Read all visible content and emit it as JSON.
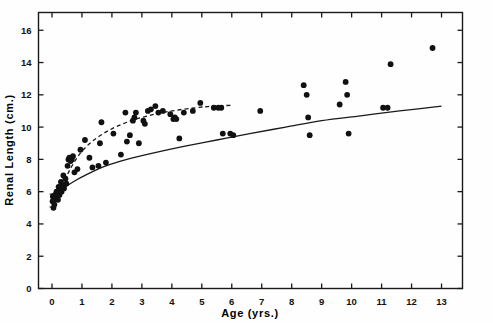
{
  "figure": {
    "title": "",
    "background_color": "#ffffff",
    "ink_color": "#111111"
  },
  "axes": {
    "x_title": "Age (yrs.)",
    "y_title": "Renal Length (cm.)",
    "x_ticks": [
      "0",
      "1",
      "2",
      "3",
      "4",
      "5",
      "6",
      "7",
      "8",
      "9",
      "10",
      "11",
      "12",
      "13"
    ],
    "y_ticks": [
      "0",
      "2",
      "4",
      "6",
      "8",
      "10",
      "12",
      "14",
      "16"
    ]
  },
  "chart_data": {
    "type": "scatter",
    "title": "",
    "xlabel": "Age (yrs.)",
    "ylabel": "Renal Length (cm.)",
    "xlim": [
      -0.45,
      13.7
    ],
    "ylim": [
      0,
      17.1
    ],
    "x_ticks": [
      0,
      1,
      2,
      3,
      4,
      5,
      6,
      7,
      8,
      9,
      10,
      11,
      12,
      13
    ],
    "y_ticks": [
      0,
      2,
      4,
      6,
      8,
      10,
      12,
      14,
      16
    ],
    "grid": false,
    "legend": null,
    "frame": "box",
    "tick_direction": "in",
    "series": [
      {
        "name": "Patient renal length measurements",
        "type": "scatter",
        "marker": "filled-circle",
        "color": "#111111",
        "points": [
          [
            0.02,
            5.4
          ],
          [
            0.03,
            5.7
          ],
          [
            0.05,
            5.0
          ],
          [
            0.06,
            5.5
          ],
          [
            0.08,
            5.2
          ],
          [
            0.1,
            5.8
          ],
          [
            0.12,
            5.6
          ],
          [
            0.15,
            6.0
          ],
          [
            0.18,
            5.9
          ],
          [
            0.2,
            5.5
          ],
          [
            0.22,
            6.3
          ],
          [
            0.25,
            5.8
          ],
          [
            0.28,
            6.2
          ],
          [
            0.3,
            6.6
          ],
          [
            0.32,
            6.0
          ],
          [
            0.35,
            6.4
          ],
          [
            0.38,
            7.0
          ],
          [
            0.4,
            6.2
          ],
          [
            0.45,
            6.8
          ],
          [
            0.48,
            6.5
          ],
          [
            0.52,
            7.6
          ],
          [
            0.55,
            8.0
          ],
          [
            0.58,
            8.1
          ],
          [
            0.62,
            7.9
          ],
          [
            0.66,
            8.0
          ],
          [
            0.7,
            8.2
          ],
          [
            0.75,
            7.2
          ],
          [
            0.85,
            7.4
          ],
          [
            0.95,
            8.6
          ],
          [
            1.1,
            9.2
          ],
          [
            1.25,
            8.1
          ],
          [
            1.35,
            7.5
          ],
          [
            1.55,
            7.6
          ],
          [
            1.6,
            9.0
          ],
          [
            1.65,
            10.3
          ],
          [
            1.8,
            7.8
          ],
          [
            2.05,
            9.6
          ],
          [
            2.3,
            8.3
          ],
          [
            2.45,
            10.9
          ],
          [
            2.5,
            9.1
          ],
          [
            2.6,
            9.5
          ],
          [
            2.7,
            10.4
          ],
          [
            2.75,
            10.6
          ],
          [
            2.8,
            10.9
          ],
          [
            2.9,
            9.0
          ],
          [
            3.05,
            10.4
          ],
          [
            3.1,
            10.2
          ],
          [
            3.2,
            11.0
          ],
          [
            3.3,
            11.1
          ],
          [
            3.45,
            11.3
          ],
          [
            3.55,
            10.9
          ],
          [
            3.7,
            11.0
          ],
          [
            3.95,
            10.8
          ],
          [
            4.05,
            10.5
          ],
          [
            4.1,
            10.6
          ],
          [
            4.15,
            10.5
          ],
          [
            4.25,
            9.3
          ],
          [
            4.4,
            10.9
          ],
          [
            4.7,
            11.0
          ],
          [
            4.95,
            11.5
          ],
          [
            5.4,
            11.2
          ],
          [
            5.55,
            11.2
          ],
          [
            5.65,
            11.2
          ],
          [
            5.7,
            9.6
          ],
          [
            5.95,
            9.6
          ],
          [
            6.05,
            9.5
          ],
          [
            6.95,
            11.0
          ],
          [
            8.4,
            12.6
          ],
          [
            8.5,
            12.0
          ],
          [
            8.55,
            10.6
          ],
          [
            8.6,
            9.5
          ],
          [
            9.6,
            11.4
          ],
          [
            9.8,
            12.8
          ],
          [
            9.85,
            12.0
          ],
          [
            9.9,
            9.6
          ],
          [
            11.05,
            11.2
          ],
          [
            11.2,
            11.2
          ],
          [
            11.3,
            13.9
          ],
          [
            12.7,
            14.9
          ]
        ]
      },
      {
        "name": "Upper reference curve (dashed, mean renal length)",
        "type": "line",
        "style": "dashed",
        "color": "#111111",
        "x_range": [
          0.25,
          6.0
        ],
        "points": [
          [
            0.25,
            5.9
          ],
          [
            0.45,
            6.8
          ],
          [
            0.7,
            7.7
          ],
          [
            1.0,
            8.5
          ],
          [
            1.4,
            9.2
          ],
          [
            1.9,
            9.8
          ],
          [
            2.5,
            10.3
          ],
          [
            3.2,
            10.7
          ],
          [
            4.0,
            11.0
          ],
          [
            4.8,
            11.2
          ],
          [
            5.4,
            11.3
          ],
          [
            6.0,
            11.35
          ]
        ]
      },
      {
        "name": "Lower reference curve (solid, predicted renal length)",
        "type": "line",
        "style": "solid",
        "color": "#111111",
        "x_range": [
          0.0,
          13.3
        ],
        "points": [
          [
            0.0,
            5.7
          ],
          [
            0.3,
            6.1
          ],
          [
            0.7,
            6.6
          ],
          [
            1.2,
            7.1
          ],
          [
            1.8,
            7.6
          ],
          [
            2.5,
            8.0
          ],
          [
            3.4,
            8.4
          ],
          [
            4.4,
            8.8
          ],
          [
            5.5,
            9.2
          ],
          [
            6.6,
            9.6
          ],
          [
            7.8,
            10.0
          ],
          [
            9.0,
            10.4
          ],
          [
            10.3,
            10.7
          ],
          [
            11.6,
            11.0
          ],
          [
            13.0,
            11.3
          ]
        ]
      },
      {
        "name": "Error bar near origin",
        "type": "errorbar",
        "color": "#111111",
        "x": 0.02,
        "y": 5.45,
        "y_low": 5.05,
        "y_high": 5.85
      }
    ]
  }
}
